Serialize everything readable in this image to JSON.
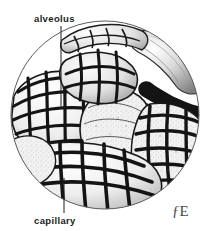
{
  "figure": {
    "title_visible": false,
    "background_color": "#ffffff",
    "ink_color": "#1a1a1a",
    "mid_tone_color": "#8c8c8c",
    "light_tone_color": "#d8d8d8",
    "vignette": {
      "shape": "circle",
      "center_x": 105,
      "center_y": 115,
      "radius": 95,
      "stroke_color": "#555555"
    },
    "labels": [
      {
        "id": "alveolus",
        "text": "alveolus",
        "x": 34,
        "y": 22,
        "leader_line": {
          "x1": 61,
          "y1": 26,
          "x2": 61,
          "y2": 106
        }
      },
      {
        "id": "capillary",
        "text": "capillary",
        "x": 34,
        "y": 224,
        "leader_line": {
          "x1": 64,
          "y1": 213,
          "x2": 64,
          "y2": 178
        }
      }
    ],
    "signature": {
      "text": "ƒE",
      "x": 172,
      "y": 216,
      "description": "artist-monogram"
    },
    "style": "pen-and-ink stipple anatomical illustration"
  }
}
